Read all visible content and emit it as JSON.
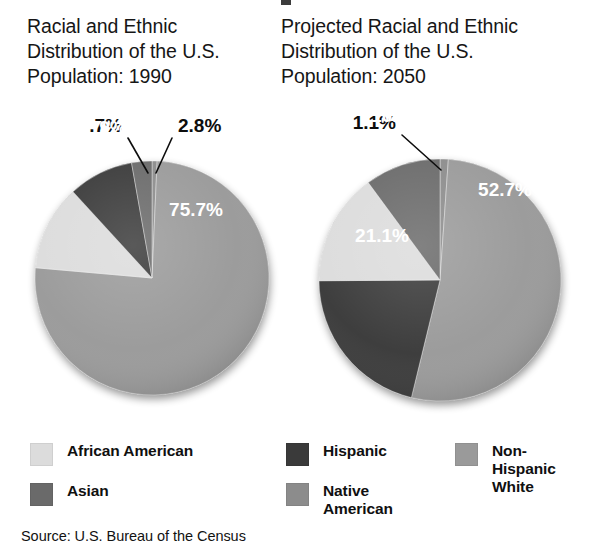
{
  "chart_data": [
    {
      "type": "pie",
      "title": "Racial and Ethnic\nDistribution of the U.S.\nPopulation: 1990",
      "year": "1990",
      "categories": [
        "Native American",
        "Non-Hispanic White",
        "African American",
        "Hispanic",
        "Asian"
      ],
      "values": [
        0.7,
        75.7,
        11.8,
        9,
        2.8
      ],
      "labels": [
        ".7%",
        "75.7%",
        "11.8%",
        "9%",
        "2.8%"
      ],
      "label_placement": [
        "outside",
        "inside",
        "inside",
        "inside",
        "outside"
      ],
      "colors": [
        "#8c8c8c",
        "#9a9a9a",
        "#dcdcdc",
        "#3a3a3a",
        "#6a6a6a"
      ],
      "start_angle_deg": 0,
      "direction": "clockwise",
      "legend_position": "bottom"
    },
    {
      "type": "pie",
      "title": "Projected Racial and Ethnic\nDistribution of the U.S.\nPopulation: 2050",
      "year": "2050",
      "categories": [
        "Native American",
        "Non-Hispanic White",
        "Hispanic",
        "African American",
        "Asian"
      ],
      "values": [
        1.1,
        52.7,
        21.1,
        15,
        10.1
      ],
      "labels": [
        "1.1%",
        "52.7%",
        "21.1%",
        "15%",
        "10.1%"
      ],
      "label_placement": [
        "outside",
        "inside",
        "inside",
        "inside",
        "inside"
      ],
      "colors": [
        "#8c8c8c",
        "#9a9a9a",
        "#3a3a3a",
        "#dcdcdc",
        "#6a6a6a"
      ],
      "start_angle_deg": 0,
      "direction": "clockwise",
      "legend_position": "bottom"
    }
  ],
  "titles": {
    "left": "Racial and Ethnic\nDistribution of the U.S.\nPopulation: 1990",
    "right": "Projected Racial and Ethnic\nDistribution of the U.S.\nPopulation: 2050"
  },
  "legend": {
    "items": [
      {
        "label": "African American",
        "color": "#dcdcdc"
      },
      {
        "label": "Asian",
        "color": "#6a6a6a"
      },
      {
        "label": "Hispanic",
        "color": "#3a3a3a"
      },
      {
        "label": "Native\nAmerican",
        "color": "#8c8c8c"
      },
      {
        "label": "Non-Hispanic\nWhite",
        "color": "#9a9a9a"
      }
    ]
  },
  "source": {
    "text": "Source: U.S. Bureau of the Census"
  },
  "geometry": {
    "pies": [
      {
        "cx": 152,
        "cy": 174,
        "r": 117
      },
      {
        "cx": 440,
        "cy": 176,
        "r": 121
      }
    ],
    "label_offsets": [
      [
        {
          "lx": 122,
          "ly": 28,
          "anchor": "end",
          "tip_x": 148,
          "tip_y": 69
        },
        {
          "lx": 196,
          "ly": 112,
          "anchor": "middle"
        },
        {
          "lx": 80,
          "ly": 44,
          "anchor": "middle"
        },
        {
          "lx": 113,
          "ly": 30,
          "anchor": "middle"
        },
        {
          "lx": 178,
          "ly": 28,
          "anchor": "start",
          "tip_x": 156,
          "tip_y": 69
        }
      ],
      [
        {
          "lx": 396,
          "ly": 25,
          "anchor": "end",
          "tip_x": 441,
          "tip_y": 66
        },
        {
          "lx": 505,
          "ly": 92,
          "anchor": "middle"
        },
        {
          "lx": 382,
          "ly": 138,
          "anchor": "middle"
        },
        {
          "lx": 358,
          "ly": 60,
          "anchor": "middle"
        },
        {
          "lx": 398,
          "ly": 18,
          "anchor": "middle"
        }
      ]
    ]
  }
}
